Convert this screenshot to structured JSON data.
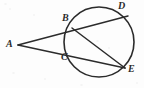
{
  "figure": {
    "name": "circle-with-two-secants-from-external-point",
    "background_color": "#fdfdfd",
    "stroke_color": "#2b2b2b",
    "width": 144,
    "height": 88
  },
  "circle": {
    "label": "circle",
    "cx": 99,
    "cy": 42,
    "r": 35,
    "stroke_width": 1.6
  },
  "points": [
    {
      "id": "A",
      "label": "A",
      "x": 18,
      "y": 45,
      "on_circle": false,
      "label_x": 6,
      "label_y": 39
    },
    {
      "id": "B",
      "label": "B",
      "x": 72,
      "y": 28,
      "on_circle": true,
      "label_x": 62,
      "label_y": 13
    },
    {
      "id": "C",
      "label": "C",
      "x": 70,
      "y": 54,
      "on_circle": true,
      "label_x": 61,
      "label_y": 52
    },
    {
      "id": "D",
      "label": "D",
      "x": 128,
      "y": 16,
      "on_circle": true,
      "label_x": 118,
      "label_y": 1
    },
    {
      "id": "E",
      "label": "E",
      "x": 125,
      "y": 68,
      "on_circle": true,
      "label_x": 128,
      "label_y": 64
    }
  ],
  "segments": [
    {
      "id": "AD",
      "from": "A",
      "to": "D",
      "through": "B",
      "kind": "secant",
      "stroke_width": 1.5
    },
    {
      "id": "AE",
      "from": "A",
      "to": "E",
      "through": "C",
      "kind": "secant",
      "stroke_width": 1.5
    },
    {
      "id": "BE",
      "from": "B",
      "to": "E",
      "through": "",
      "kind": "chord",
      "stroke_width": 1.5
    }
  ],
  "paths": {
    "secant_A_to_D": "M 18 45 L 128 16",
    "secant_A_to_E": "M 18 45 L 125 68",
    "chord_B_to_E": "M 72 28 L 125 68"
  },
  "flecks": [
    {
      "x": 4,
      "y": 3,
      "w": 3,
      "h": 2
    },
    {
      "x": 9,
      "y": 8,
      "w": 2,
      "h": 2
    },
    {
      "x": 33,
      "y": 14,
      "w": 2,
      "h": 2
    },
    {
      "x": 12,
      "y": 72,
      "w": 3,
      "h": 2
    },
    {
      "x": 44,
      "y": 78,
      "w": 2,
      "h": 2
    },
    {
      "x": 96,
      "y": 40,
      "w": 3,
      "h": 2
    },
    {
      "x": 108,
      "y": 47,
      "w": 2,
      "h": 2
    },
    {
      "x": 136,
      "y": 82,
      "w": 2,
      "h": 2
    },
    {
      "x": 80,
      "y": 84,
      "w": 3,
      "h": 2
    }
  ]
}
